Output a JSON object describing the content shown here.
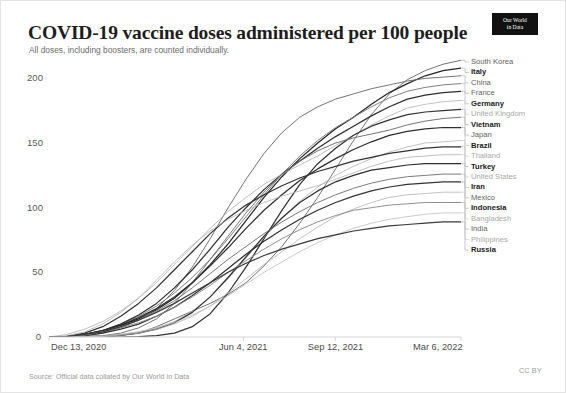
{
  "header": {
    "title": "COVID-19 vaccine doses administered per 100 people",
    "subtitle": "All doses, including boosters, are counted individually.",
    "logo_line1": "Our World",
    "logo_line2": "in Data"
  },
  "footer": {
    "source": "Source: Official data collated by Our World in Data",
    "license": "CC BY"
  },
  "chart_data": {
    "type": "line",
    "title": "COVID-19 vaccine doses administered per 100 people",
    "subtitle": "All doses, including boosters, are counted individually.",
    "xlabel": "",
    "ylabel": "",
    "grid": false,
    "legend_position": "right-inline-labels",
    "ylim": [
      0,
      215
    ],
    "yticks": [
      0,
      50,
      100,
      150,
      200
    ],
    "ytick_labels": [
      "0",
      "50",
      "100",
      "150",
      "200"
    ],
    "xticks": [
      "Dec 13, 2020",
      "Jun 4, 2021",
      "Sep 12, 2021",
      "Mar 6, 2022"
    ],
    "xtick_positions": [
      0,
      0.472,
      0.695,
      1.0
    ],
    "x_range": [
      "Dec 13, 2020",
      "Mar 6, 2022"
    ],
    "series": [
      {
        "name": "South Korea",
        "emphasis": "medium",
        "color": "#6e6e6e",
        "end_value": 214,
        "values": [
          0,
          0,
          0,
          0.2,
          1,
          3,
          8,
          14,
          20,
          26,
          33,
          42,
          55,
          70,
          88,
          108,
          130,
          152,
          172,
          188,
          199,
          206,
          211,
          214
        ]
      },
      {
        "name": "Italy",
        "emphasis": "bold",
        "color": "#262626",
        "end_value": 208,
        "values": [
          0,
          0.3,
          2,
          5,
          9,
          14,
          21,
          30,
          42,
          56,
          72,
          90,
          108,
          124,
          138,
          150,
          161,
          170,
          180,
          189,
          196,
          202,
          206,
          208
        ]
      },
      {
        "name": "China",
        "emphasis": "medium",
        "color": "#6e6e6e",
        "end_value": 202,
        "values": [
          0,
          0.2,
          1,
          3,
          7,
          13,
          22,
          36,
          54,
          76,
          100,
          122,
          142,
          158,
          170,
          178,
          184,
          188,
          192,
          195,
          198,
          200,
          201,
          202
        ]
      },
      {
        "name": "France",
        "emphasis": "medium",
        "color": "#787878",
        "end_value": 196,
        "values": [
          0,
          0.4,
          2,
          5,
          10,
          16,
          24,
          34,
          46,
          60,
          76,
          93,
          110,
          126,
          140,
          152,
          162,
          170,
          178,
          185,
          190,
          193,
          195,
          196
        ]
      },
      {
        "name": "Germany",
        "emphasis": "bold",
        "color": "#2e2e2e",
        "end_value": 190,
        "values": [
          0,
          0.3,
          2,
          5,
          10,
          17,
          26,
          38,
          52,
          68,
          85,
          100,
          114,
          126,
          136,
          146,
          155,
          163,
          171,
          178,
          184,
          187,
          189,
          190
        ]
      },
      {
        "name": "United Kingdom",
        "emphasis": "light",
        "color": "#b0b0b0",
        "end_value": 183,
        "values": [
          0,
          2,
          6,
          12,
          20,
          30,
          42,
          56,
          70,
          84,
          97,
          108,
          118,
          126,
          133,
          140,
          148,
          156,
          164,
          171,
          177,
          180,
          182,
          183
        ]
      },
      {
        "name": "Vietnam",
        "emphasis": "bold",
        "color": "#333333",
        "end_value": 176,
        "values": [
          0,
          0,
          0,
          0,
          0,
          0.2,
          1,
          3,
          8,
          18,
          34,
          54,
          76,
          98,
          118,
          134,
          146,
          156,
          163,
          168,
          172,
          174,
          175,
          176
        ]
      },
      {
        "name": "Japan",
        "emphasis": "medium",
        "color": "#6e6e6e",
        "end_value": 170,
        "values": [
          0,
          0,
          0.2,
          1,
          3,
          7,
          14,
          26,
          42,
          60,
          78,
          96,
          112,
          126,
          136,
          144,
          150,
          154,
          157,
          160,
          164,
          167,
          169,
          170
        ]
      },
      {
        "name": "Brazil",
        "emphasis": "bold",
        "color": "#2e2e2e",
        "end_value": 162,
        "values": [
          0,
          0.5,
          2,
          5,
          9,
          15,
          22,
          31,
          42,
          55,
          69,
          84,
          98,
          110,
          121,
          130,
          138,
          145,
          151,
          156,
          159,
          161,
          162,
          162
        ]
      },
      {
        "name": "Thailand",
        "emphasis": "light",
        "color": "#b4b4b4",
        "end_value": 152,
        "values": [
          0,
          0,
          0.2,
          1,
          2,
          4,
          7,
          12,
          20,
          31,
          45,
          61,
          77,
          92,
          105,
          116,
          125,
          132,
          138,
          143,
          147,
          150,
          151,
          152
        ]
      },
      {
        "name": "Turkey",
        "emphasis": "bold",
        "color": "#333333",
        "end_value": 147,
        "values": [
          0,
          0.5,
          3,
          8,
          16,
          26,
          38,
          52,
          66,
          80,
          92,
          102,
          110,
          117,
          123,
          128,
          132,
          136,
          139,
          142,
          144,
          146,
          147,
          147
        ]
      },
      {
        "name": "United States",
        "emphasis": "light",
        "color": "#b0b0b0",
        "end_value": 141,
        "values": [
          0,
          1,
          4,
          10,
          19,
          30,
          44,
          58,
          71,
          82,
          91,
          98,
          104,
          109,
          113,
          117,
          122,
          127,
          132,
          136,
          139,
          140,
          141,
          141
        ]
      },
      {
        "name": "Iran",
        "emphasis": "bold",
        "color": "#2e2e2e",
        "end_value": 134,
        "values": [
          0,
          0,
          0.2,
          0.6,
          1.5,
          3,
          6,
          11,
          19,
          31,
          46,
          62,
          78,
          92,
          104,
          113,
          120,
          125,
          129,
          131,
          133,
          134,
          134,
          134
        ]
      },
      {
        "name": "Mexico",
        "emphasis": "medium",
        "color": "#747474",
        "end_value": 126,
        "values": [
          0,
          0.3,
          1.5,
          4,
          8,
          13,
          20,
          28,
          38,
          49,
          60,
          70,
          80,
          89,
          97,
          104,
          110,
          115,
          119,
          122,
          124,
          125,
          126,
          126
        ]
      },
      {
        "name": "Indonesia",
        "emphasis": "bold",
        "color": "#333333",
        "end_value": 120,
        "values": [
          0,
          0.2,
          1,
          3,
          6,
          10,
          16,
          23,
          32,
          42,
          53,
          64,
          74,
          83,
          91,
          98,
          104,
          109,
          113,
          116,
          118,
          119,
          120,
          120
        ]
      },
      {
        "name": "Bangladesh",
        "emphasis": "light",
        "color": "#b4b4b4",
        "end_value": 112,
        "values": [
          0,
          0,
          0.1,
          0.5,
          1.5,
          3,
          6,
          10,
          16,
          24,
          34,
          45,
          56,
          66,
          76,
          85,
          93,
          99,
          104,
          108,
          110,
          111,
          112,
          112
        ]
      },
      {
        "name": "India",
        "emphasis": "medium",
        "color": "#8a8a8a",
        "end_value": 104,
        "values": [
          0,
          0.3,
          1.5,
          4,
          7,
          11,
          16,
          23,
          31,
          40,
          50,
          59,
          68,
          76,
          83,
          89,
          94,
          98,
          100,
          102,
          103,
          104,
          104,
          104
        ]
      },
      {
        "name": "Philippines",
        "emphasis": "light",
        "color": "#bdbdbd",
        "end_value": 96,
        "values": [
          0,
          0,
          0.2,
          0.8,
          2,
          4,
          7,
          11,
          17,
          24,
          32,
          41,
          50,
          58,
          66,
          73,
          79,
          84,
          88,
          91,
          93,
          95,
          96,
          96
        ]
      },
      {
        "name": "Russia",
        "emphasis": "bold",
        "color": "#3a3a3a",
        "end_value": 89,
        "values": [
          0,
          0.4,
          2,
          4,
          8,
          13,
          19,
          26,
          34,
          42,
          50,
          57,
          63,
          68,
          72,
          76,
          79,
          82,
          84,
          86,
          87,
          88,
          89,
          89
        ]
      }
    ]
  }
}
